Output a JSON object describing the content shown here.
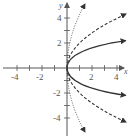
{
  "diagram": {
    "type": "function-graph",
    "axes": {
      "x_label": "x",
      "y_label": "y",
      "x_ticks": [
        "-4",
        "-2",
        "2",
        "4"
      ],
      "y_ticks": [
        "4",
        "2",
        "-2",
        "-4"
      ],
      "x_range": [
        -5,
        5
      ],
      "y_range": [
        -5,
        5
      ]
    },
    "curves": [
      {
        "name": "solid",
        "style": "solid",
        "equation": "x = y^2"
      },
      {
        "name": "dashed",
        "style": "dashed",
        "equation": "x = y^2/4"
      },
      {
        "name": "dotted",
        "style": "dotted",
        "equation": "x = y^2/16"
      }
    ],
    "colors": {
      "axis": "#555555",
      "curve": "#333333"
    }
  }
}
